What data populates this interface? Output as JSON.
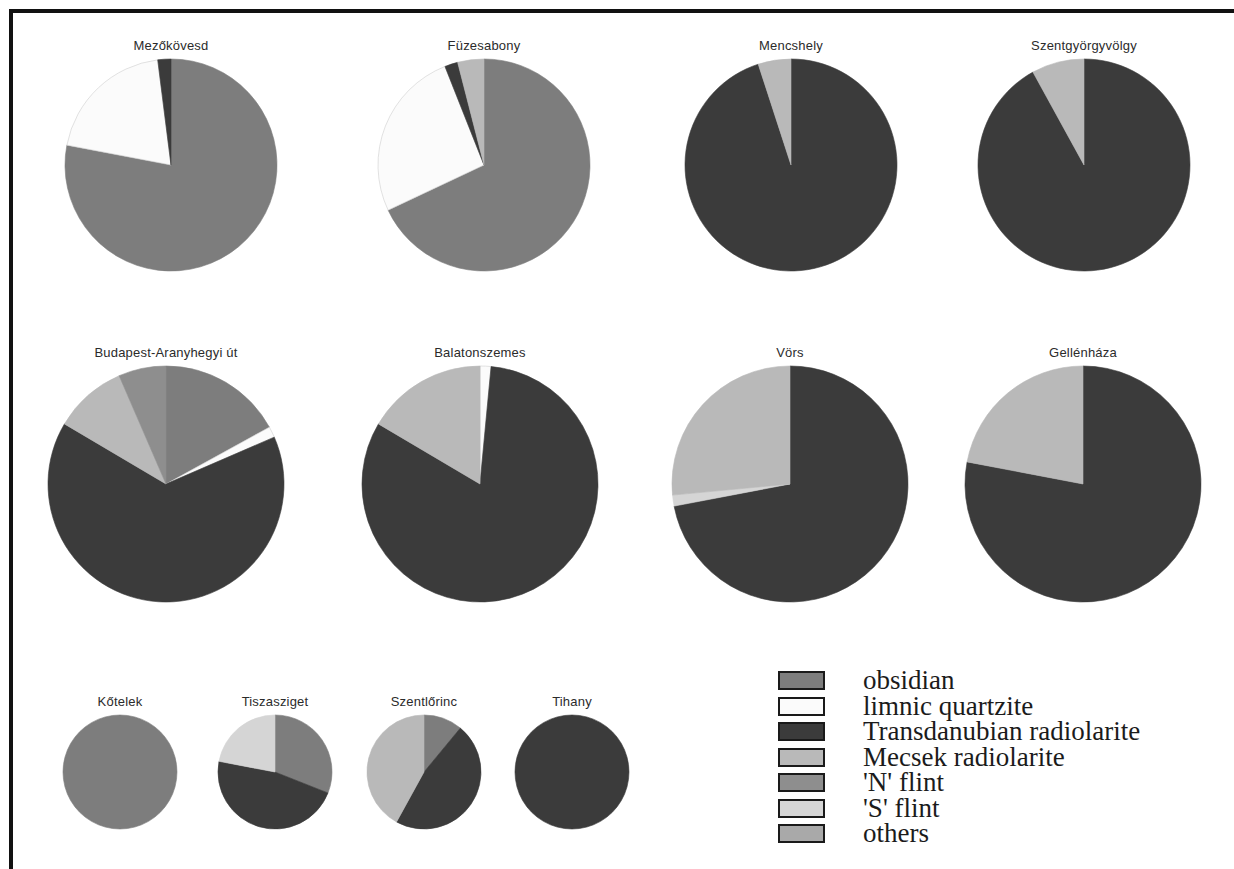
{
  "figure": {
    "background": "#ffffff",
    "frame_color": "#111111"
  },
  "palette": {
    "obsidian": "#7d7d7d",
    "limnic_quartzite": "#fbfbfb",
    "transdanubian_radiolarite": "#3b3b3b",
    "mecsek_radiolarite": "#b9b9b9",
    "n_flint": "#8e8e8e",
    "s_flint": "#d5d5d5",
    "others": "#a9a9a9"
  },
  "legend": {
    "title": "",
    "items": [
      {
        "label": "obsidian",
        "color": "#7d7d7d"
      },
      {
        "label": "limnic quartzite",
        "color": "#fbfbfb"
      },
      {
        "label": "Transdanubian radiolarite",
        "color": "#3b3b3b"
      },
      {
        "label": "Mecsek radiolarite",
        "color": "#b9b9b9"
      },
      {
        "label": "'N' flint",
        "color": "#8e8e8e"
      },
      {
        "label": "'S' flint",
        "color": "#d5d5d5"
      },
      {
        "label": "others",
        "color": "#a9a9a9"
      }
    ]
  },
  "chart_data": {
    "type": "pie",
    "title": "",
    "legend_position": "bottom-right",
    "categories": [
      "obsidian",
      "limnic quartzite",
      "Transdanubian radiolarite",
      "Mecsek radiolarite",
      "'N' flint",
      "'S' flint",
      "others"
    ],
    "units": "percent",
    "charts": [
      {
        "title": "Mezőkövesd",
        "row": 1,
        "radius_px": 106,
        "slices": [
          {
            "name": "obsidian",
            "value": 78,
            "color": "#7d7d7d"
          },
          {
            "name": "limnic quartzite",
            "value": 20,
            "color": "#fbfbfb"
          },
          {
            "name": "Transdanubian radiolarite",
            "value": 2,
            "color": "#3b3b3b"
          }
        ]
      },
      {
        "title": "Füzesabony",
        "row": 1,
        "radius_px": 106,
        "slices": [
          {
            "name": "obsidian",
            "value": 68,
            "color": "#7d7d7d"
          },
          {
            "name": "limnic quartzite",
            "value": 26,
            "color": "#fbfbfb"
          },
          {
            "name": "Transdanubian radiolarite",
            "value": 2,
            "color": "#3b3b3b"
          },
          {
            "name": "Mecsek radiolarite",
            "value": 4,
            "color": "#b9b9b9"
          }
        ]
      },
      {
        "title": "Mencshely",
        "row": 1,
        "radius_px": 106,
        "slices": [
          {
            "name": "Transdanubian radiolarite",
            "value": 95,
            "color": "#3b3b3b"
          },
          {
            "name": "Mecsek radiolarite",
            "value": 5,
            "color": "#b9b9b9"
          }
        ]
      },
      {
        "title": "Szentgyörgyvölgy",
        "row": 1,
        "radius_px": 106,
        "slices": [
          {
            "name": "Transdanubian radiolarite",
            "value": 92,
            "color": "#3b3b3b"
          },
          {
            "name": "Mecsek radiolarite",
            "value": 8,
            "color": "#b9b9b9"
          }
        ]
      },
      {
        "title": "Budapest-Aranyhegyi út",
        "row": 2,
        "radius_px": 118,
        "slices": [
          {
            "name": "obsidian",
            "value": 17,
            "color": "#7d7d7d"
          },
          {
            "name": "limnic quartzite",
            "value": 1.5,
            "color": "#fbfbfb"
          },
          {
            "name": "Transdanubian radiolarite",
            "value": 65,
            "color": "#3b3b3b"
          },
          {
            "name": "Mecsek radiolarite",
            "value": 10,
            "color": "#b9b9b9"
          },
          {
            "name": "'N' flint",
            "value": 6.5,
            "color": "#8e8e8e"
          }
        ]
      },
      {
        "title": "Balatonszemes",
        "row": 2,
        "radius_px": 118,
        "slices": [
          {
            "name": "limnic quartzite",
            "value": 1.5,
            "color": "#fbfbfb"
          },
          {
            "name": "Transdanubian radiolarite",
            "value": 82,
            "color": "#3b3b3b"
          },
          {
            "name": "Mecsek radiolarite",
            "value": 16.5,
            "color": "#b9b9b9"
          }
        ]
      },
      {
        "title": "Vörs",
        "row": 2,
        "radius_px": 118,
        "slices": [
          {
            "name": "Transdanubian radiolarite",
            "value": 72,
            "color": "#3b3b3b"
          },
          {
            "name": "'S' flint",
            "value": 1.5,
            "color": "#d5d5d5"
          },
          {
            "name": "Mecsek radiolarite",
            "value": 26.5,
            "color": "#b9b9b9"
          }
        ]
      },
      {
        "title": "Gellénháza",
        "row": 2,
        "radius_px": 118,
        "slices": [
          {
            "name": "Transdanubian radiolarite",
            "value": 78,
            "color": "#3b3b3b"
          },
          {
            "name": "Mecsek radiolarite",
            "value": 22,
            "color": "#b9b9b9"
          }
        ]
      },
      {
        "title": "Kőtelek",
        "row": 3,
        "radius_px": 57,
        "slices": [
          {
            "name": "obsidian",
            "value": 100,
            "color": "#7d7d7d"
          }
        ]
      },
      {
        "title": "Tiszasziget",
        "row": 3,
        "radius_px": 57,
        "slices": [
          {
            "name": "obsidian",
            "value": 31,
            "color": "#7d7d7d"
          },
          {
            "name": "Transdanubian radiolarite",
            "value": 47,
            "color": "#3b3b3b"
          },
          {
            "name": "'S' flint",
            "value": 22,
            "color": "#d5d5d5"
          }
        ]
      },
      {
        "title": "Szentlőrinc",
        "row": 3,
        "radius_px": 57,
        "slices": [
          {
            "name": "obsidian",
            "value": 11,
            "color": "#7d7d7d"
          },
          {
            "name": "Transdanubian radiolarite",
            "value": 47,
            "color": "#3b3b3b"
          },
          {
            "name": "Mecsek radiolarite",
            "value": 42,
            "color": "#b9b9b9"
          }
        ]
      },
      {
        "title": "Tihany",
        "row": 3,
        "radius_px": 57,
        "slices": [
          {
            "name": "Transdanubian radiolarite",
            "value": 100,
            "color": "#3b3b3b"
          }
        ]
      }
    ]
  },
  "layout": {
    "positions": [
      {
        "cx": 171,
        "cy": 170
      },
      {
        "cx": 484,
        "cy": 170
      },
      {
        "cx": 791,
        "cy": 170
      },
      {
        "cx": 1084,
        "cy": 170
      },
      {
        "cx": 166,
        "cy": 489
      },
      {
        "cx": 480,
        "cy": 489
      },
      {
        "cx": 790,
        "cy": 489
      },
      {
        "cx": 1083,
        "cy": 489
      },
      {
        "cx": 120,
        "cy": 777
      },
      {
        "cx": 275,
        "cy": 777
      },
      {
        "cx": 424,
        "cy": 777
      },
      {
        "cx": 572,
        "cy": 777
      }
    ]
  }
}
